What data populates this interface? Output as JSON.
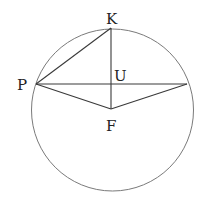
{
  "diagram": {
    "circle": {
      "cx": 112.5,
      "cy": 110,
      "r": 81,
      "stroke": "#7a7a7a"
    },
    "points": {
      "K": {
        "x": 111,
        "y": 28
      },
      "P": {
        "x": 36,
        "y": 84
      },
      "R": {
        "x": 187,
        "y": 84
      },
      "U": {
        "x": 111,
        "y": 84
      },
      "F": {
        "x": 111,
        "y": 109
      }
    },
    "labels": {
      "K": "K",
      "P": "P",
      "U": "U",
      "F": "F"
    },
    "segments": [
      [
        "P",
        "K"
      ],
      [
        "K",
        "F"
      ],
      [
        "P",
        "R"
      ],
      [
        "P",
        "F"
      ],
      [
        "F",
        "R"
      ]
    ],
    "line_color": "#3a3a3a"
  }
}
